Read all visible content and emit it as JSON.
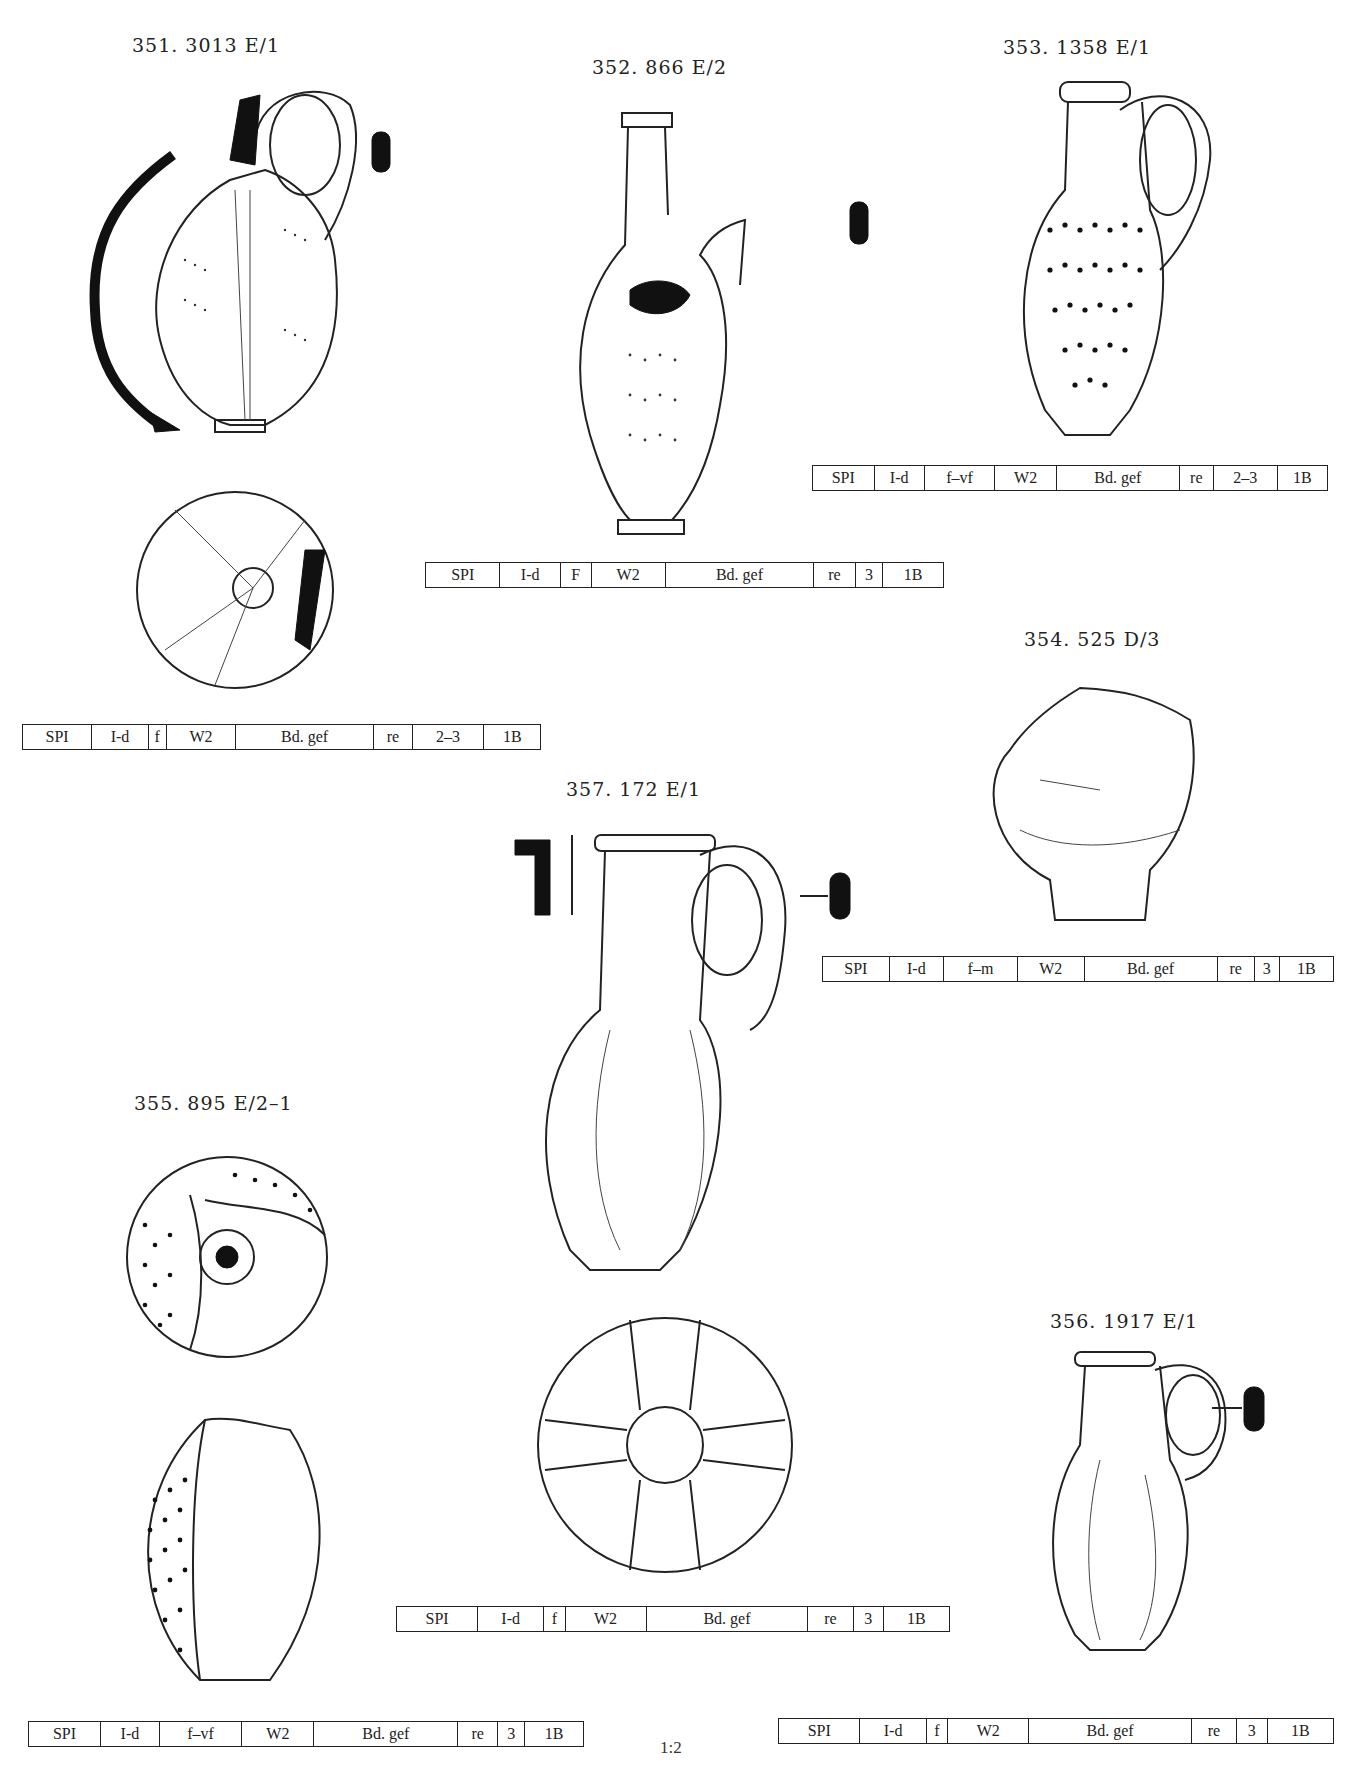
{
  "page": {
    "scale_label": "1:2"
  },
  "items": [
    {
      "id": "351",
      "caption": "351. 3013 E/1",
      "table": [
        "SPI",
        "I-d",
        "f",
        "W2",
        "Bd. gef",
        "re",
        "2–3",
        "1B"
      ]
    },
    {
      "id": "352",
      "caption": "352. 866 E/2",
      "table": [
        "SPI",
        "I-d",
        "F",
        "W2",
        "Bd. gef",
        "re",
        "3",
        "1B"
      ]
    },
    {
      "id": "353",
      "caption": "353. 1358 E/1",
      "table": [
        "SPI",
        "I-d",
        "f–vf",
        "W2",
        "Bd. gef",
        "re",
        "2–3",
        "1B"
      ]
    },
    {
      "id": "354",
      "caption": "354. 525 D/3",
      "table": [
        "SPI",
        "I-d",
        "f–m",
        "W2",
        "Bd. gef",
        "re",
        "3",
        "1B"
      ]
    },
    {
      "id": "355",
      "caption": "355. 895 E/2–1",
      "table": [
        "SPI",
        "I-d",
        "f–vf",
        "W2",
        "Bd. gef",
        "re",
        "3",
        "1B"
      ]
    },
    {
      "id": "356",
      "caption": "356. 1917 E/1",
      "table": [
        "SPI",
        "I-d",
        "f",
        "W2",
        "Bd. gef",
        "re",
        "3",
        "1B"
      ]
    },
    {
      "id": "357",
      "caption": "357. 172 E/1",
      "table": [
        "SPI",
        "I-d",
        "f",
        "W2",
        "Bd. gef",
        "re",
        "3",
        "1B"
      ]
    }
  ]
}
